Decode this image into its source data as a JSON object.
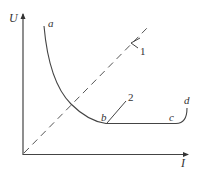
{
  "diagram": {
    "axes": {
      "y_label": "U",
      "x_label": "I"
    },
    "curve": {
      "points": {
        "a": "a",
        "b": "b",
        "c": "c",
        "d": "d"
      }
    },
    "callouts": {
      "line_1": "1",
      "line_2": "2"
    },
    "colors": {
      "stroke": "#444444",
      "text": "#333333",
      "background": "#ffffff"
    }
  }
}
